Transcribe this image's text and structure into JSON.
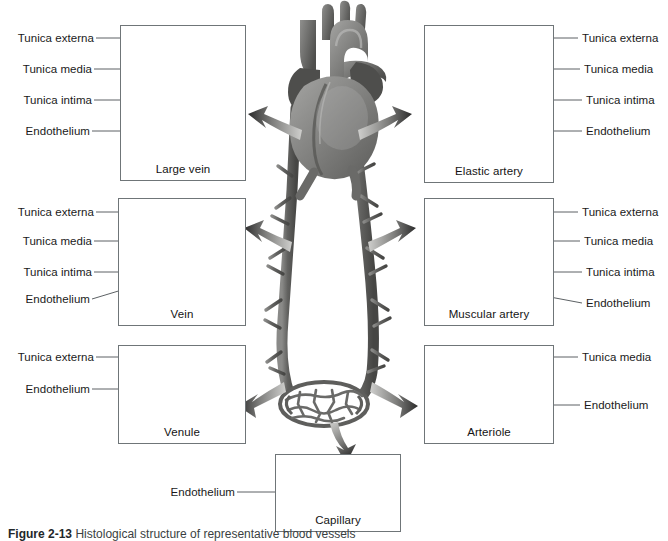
{
  "figure": {
    "caption_label": "Figure 2-13",
    "caption_text": "Histological structure of representative blood vessels",
    "background": "#ffffff",
    "line_color": "#6f7578",
    "text_color": "#1a1a1a"
  },
  "center": {
    "heart_label": "heart",
    "artery_path_label": "artery",
    "vein_path_label": "vein",
    "capillary_bed_label": "capillary bed"
  },
  "panels": [
    {
      "id": "large-vein",
      "title": "Large vein",
      "side": "left",
      "labels": [
        "Tunica externa",
        "Tunica media",
        "Tunica intima",
        "Endothelium"
      ],
      "vessel": "large-vein-cross-section"
    },
    {
      "id": "elastic-artery",
      "title": "Elastic artery",
      "side": "right",
      "labels": [
        "Tunica externa",
        "Tunica media",
        "Tunica intima",
        "Endothelium"
      ],
      "vessel": "elastic-artery-cross-section"
    },
    {
      "id": "vein",
      "title": "Vein",
      "side": "left",
      "labels": [
        "Tunica externa",
        "Tunica media",
        "Tunica intima",
        "Endothelium"
      ],
      "vessel": "vein-cross-section"
    },
    {
      "id": "muscular-artery",
      "title": "Muscular artery",
      "side": "right",
      "labels": [
        "Tunica externa",
        "Tunica media",
        "Tunica intima",
        "Endothelium"
      ],
      "vessel": "muscular-artery-cross-section"
    },
    {
      "id": "venule",
      "title": "Venule",
      "side": "left",
      "labels": [
        "Tunica externa",
        "Endothelium"
      ],
      "vessel": "venule-cross-section"
    },
    {
      "id": "arteriole",
      "title": "Arteriole",
      "side": "right",
      "labels": [
        "Tunica media",
        "Endothelium"
      ],
      "vessel": "arteriole-cross-section"
    },
    {
      "id": "capillary",
      "title": "Capillary",
      "side": "bottom",
      "labels": [
        "Endothelium"
      ],
      "vessel": "capillary-tube"
    }
  ],
  "labels": {
    "tunica_externa": "Tunica externa",
    "tunica_media": "Tunica media",
    "tunica_intima": "Tunica intima",
    "endothelium": "Endothelium"
  }
}
